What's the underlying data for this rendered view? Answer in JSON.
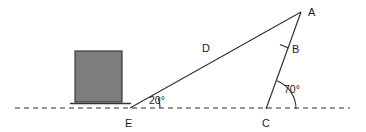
{
  "figure": {
    "background_color": "#ffffff",
    "stroke_color": "#333333",
    "width": 366,
    "height": 132
  },
  "vertices": {
    "a": {
      "label": "A",
      "x": 301,
      "y": 12,
      "label_x": 308,
      "label_y": 13
    },
    "b": {
      "label": "B",
      "x": 284,
      "y": 46,
      "label_x": 292,
      "label_y": 50
    },
    "c": {
      "label": "C",
      "x": 266,
      "y": 109,
      "label_x": 262,
      "label_y": 124
    },
    "e": {
      "label": "E",
      "x": 130,
      "y": 108,
      "label_x": 125,
      "label_y": 124
    }
  },
  "sides": {
    "hypotenuse": {
      "label": "D",
      "label_x": 202,
      "label_y": 49,
      "from": "E",
      "to": "A"
    }
  },
  "angles": {
    "at_e": {
      "label": "20°",
      "value": 20,
      "unit": "degrees",
      "label_x": 149,
      "label_y": 101,
      "vertex": "E"
    },
    "at_c": {
      "label": "70°",
      "value": 70,
      "unit": "degrees",
      "label_x": 284,
      "label_y": 90,
      "vertex": "C"
    }
  },
  "block": {
    "name": "gray-block",
    "fill_color": "#7d7d7d",
    "stroke_color": "#3a3a3a",
    "x": 75,
    "y": 51,
    "width": 47,
    "height": 51
  },
  "ground": {
    "dashed_line": {
      "x1": 15,
      "y1": 108,
      "x2": 350,
      "y2": 108,
      "style": "dashed"
    },
    "solid_segment": {
      "x1": 70,
      "y1": 104,
      "x2": 131,
      "y2": 104,
      "style": "solid"
    }
  },
  "tick_mark": {
    "name": "b-tick",
    "x1": 280,
    "y1": 44,
    "x2": 288,
    "y2": 48
  }
}
